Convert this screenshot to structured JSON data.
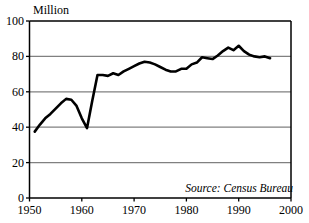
{
  "chart_data": {
    "type": "line",
    "title": "",
    "subtitle": "",
    "unit_label": "Million",
    "xlabel": "",
    "ylabel": "",
    "xlim": [
      1950,
      2000
    ],
    "ylim": [
      0,
      100
    ],
    "xticks": [
      1950,
      1960,
      1970,
      1980,
      1990,
      2000
    ],
    "xtick_labels": [
      "1950",
      "1960",
      "1970",
      "1980",
      "1990",
      "2000"
    ],
    "yticks": [
      0,
      20,
      40,
      60,
      80,
      100
    ],
    "ytick_labels": [
      "0",
      "20",
      "40",
      "60",
      "80",
      "100"
    ],
    "grid": "horizontal",
    "legend": "none",
    "line_color": "#000000",
    "grid_color": "#808080",
    "axis_color": "#000000",
    "background": "#ffffff",
    "annotations": [
      {
        "text": "Source: Census Bureau",
        "position": "bottom-right",
        "style": "italic"
      }
    ],
    "series": [
      {
        "name": "Value",
        "x": [
          1951,
          1952,
          1953,
          1954,
          1955,
          1956,
          1957,
          1958,
          1959,
          1960,
          1961,
          1962,
          1963,
          1964,
          1965,
          1966,
          1967,
          1968,
          1969,
          1970,
          1971,
          1972,
          1973,
          1974,
          1975,
          1976,
          1977,
          1978,
          1979,
          1980,
          1981,
          1982,
          1983,
          1984,
          1985,
          1986,
          1987,
          1988,
          1989,
          1990,
          1991,
          1992,
          1993,
          1994,
          1995,
          1996
        ],
        "values": [
          37.5,
          41.5,
          45.0,
          47.5,
          50.5,
          53.5,
          56.0,
          55.5,
          52.0,
          45.0,
          39.5,
          55.0,
          69.5,
          69.5,
          69.0,
          70.5,
          69.5,
          71.5,
          73.0,
          74.5,
          76.0,
          77.0,
          76.5,
          75.5,
          74.0,
          72.5,
          71.5,
          71.5,
          73.0,
          73.0,
          75.5,
          76.5,
          79.5,
          79.0,
          78.5,
          80.5,
          83.0,
          85.0,
          83.5,
          86.0,
          83.0,
          81.0,
          80.0,
          79.5,
          80.0,
          79.0
        ]
      }
    ]
  }
}
